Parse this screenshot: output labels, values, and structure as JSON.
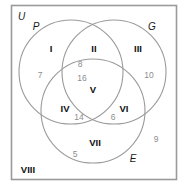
{
  "diagram": {
    "type": "venn-3-circle",
    "universe_label": "U",
    "border_color": "#9a9a9a",
    "circle_color": "#9a9a9a",
    "region_label_color": "#111111",
    "count_color": "#8d8d8d",
    "background": "#ffffff",
    "set_labels": [
      {
        "name": "set-label-p",
        "text": "P",
        "x": 37,
        "y": 27
      },
      {
        "name": "set-label-g",
        "text": "G",
        "x": 150,
        "y": 27
      },
      {
        "name": "set-label-e",
        "text": "E",
        "x": 131,
        "y": 159
      },
      {
        "name": "universe",
        "text": "U",
        "x": 18,
        "y": 17
      }
    ],
    "region_labels": [
      {
        "name": "region-i",
        "text": "I",
        "x": 50,
        "y": 50
      },
      {
        "name": "region-ii",
        "text": "II",
        "x": 94,
        "y": 50
      },
      {
        "name": "region-iii",
        "text": "III",
        "x": 137,
        "y": 50
      },
      {
        "name": "region-iv",
        "text": "IV",
        "x": 65,
        "y": 109
      },
      {
        "name": "region-v",
        "text": "V",
        "x": 93,
        "y": 90
      },
      {
        "name": "region-vi",
        "text": "VI",
        "x": 123,
        "y": 109
      },
      {
        "name": "region-vii",
        "text": "VII",
        "x": 94,
        "y": 143
      },
      {
        "name": "region-viii",
        "text": "VIII",
        "x": 26,
        "y": 170
      }
    ],
    "counts": [
      {
        "name": "count-region-i",
        "region": "I",
        "value": "7",
        "x": 40,
        "y": 75
      },
      {
        "name": "count-region-ii",
        "region": "II",
        "value": "8",
        "x": 79,
        "y": 64
      },
      {
        "name": "count-region-iii",
        "region": "III",
        "value": "10",
        "x": 148,
        "y": 75
      },
      {
        "name": "count-region-iv",
        "region": "IV",
        "value": "14",
        "x": 78,
        "y": 117
      },
      {
        "name": "count-region-v",
        "region": "V",
        "value": "16",
        "x": 81,
        "y": 79
      },
      {
        "name": "count-region-vi",
        "region": "VI",
        "value": "6",
        "x": 112,
        "y": 117
      },
      {
        "name": "count-region-vii",
        "region": "VII",
        "value": "5",
        "x": 74,
        "y": 155
      },
      {
        "name": "count-region-viii",
        "region": "VIII",
        "value": "9",
        "x": 155,
        "y": 139
      }
    ],
    "circles": [
      {
        "name": "circle-p",
        "cx": 71,
        "cy": 72,
        "r": 52
      },
      {
        "name": "circle-g",
        "cx": 114,
        "cy": 72,
        "r": 52
      },
      {
        "name": "circle-e",
        "cx": 93,
        "cy": 111,
        "r": 52
      }
    ],
    "border": {
      "x": 11,
      "y": 5,
      "width": 166,
      "height": 175
    }
  }
}
